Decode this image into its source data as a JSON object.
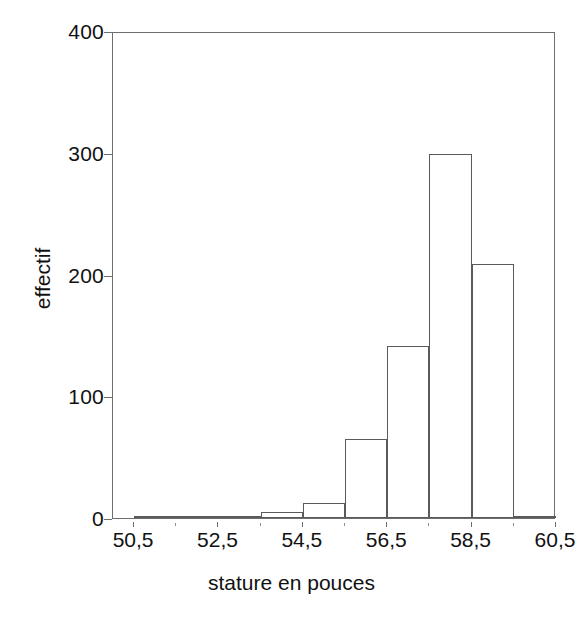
{
  "chart_data": {
    "type": "bar",
    "subtype": "histogram",
    "title": "",
    "subtitle": "",
    "xlabel": "stature en pouces",
    "ylabel": "effectif",
    "xlim": [
      50.0,
      60.5
    ],
    "ylim": [
      0,
      400
    ],
    "grid": false,
    "legend": null,
    "bin_width": 1,
    "bin_edges": [
      50.5,
      51.5,
      52.5,
      53.5,
      54.5,
      55.5,
      56.5,
      57.5,
      58.5,
      59.5,
      60.5
    ],
    "categories": [
      "50,5-51,5",
      "51,5-52,5",
      "52,5-53,5",
      "53,5-54,5",
      "54,5-55,5",
      "55,5-56,5",
      "56,5-57,5",
      "57,5-58,5",
      "58,5-59,5",
      "59,5-60,5"
    ],
    "bin_centers": [
      51.0,
      52.0,
      53.0,
      54.0,
      55.0,
      56.0,
      57.0,
      58.0,
      59.0,
      60.0
    ],
    "values": [
      1,
      1,
      1,
      5,
      12,
      65,
      141,
      299,
      209,
      0
    ],
    "xticks": [
      50.5,
      52.5,
      54.5,
      56.5,
      58.5,
      60.5
    ],
    "xticklabels": [
      "50,5",
      "52,5",
      "54,5",
      "56,5",
      "58,5",
      "60,5"
    ],
    "xticks_minor": [
      51.5,
      53.5,
      55.5,
      57.5,
      59.5
    ],
    "yticks": [
      0,
      100,
      200,
      300,
      400
    ],
    "yticklabels": [
      "0",
      "100",
      "200",
      "300",
      "400"
    ],
    "bar_edge_color": "#5a5a5a",
    "bar_fill_color": "#ffffff",
    "axis_color": "#6e6e6e",
    "text_color": "#111111",
    "background_color": "#ffffff"
  },
  "axes": {
    "y_title": "effectif",
    "x_title": "stature en pouces"
  }
}
